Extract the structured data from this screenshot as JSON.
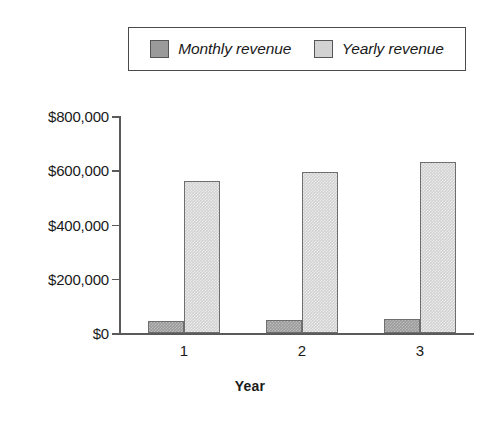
{
  "chart_data": {
    "type": "bar",
    "title": "",
    "subtitle": "",
    "xlabel": "Year",
    "ylabel": "",
    "categories": [
      "1",
      "2",
      "3"
    ],
    "series": [
      {
        "name": "Monthly revenue",
        "values": [
          45000,
          48000,
          50000
        ],
        "color": "#9a9a9a"
      },
      {
        "name": "Yearly revenue",
        "values": [
          560000,
          595000,
          630000
        ],
        "color": "#d2d2d2"
      }
    ],
    "ylim": [
      0,
      800000
    ],
    "y_ticks": [
      0,
      200000,
      400000,
      600000,
      800000
    ],
    "y_tick_labels": [
      "$0",
      "$200,000",
      "$400,000",
      "$600,000",
      "$800,000"
    ],
    "x_tick_labels": [
      "1",
      "2",
      "3"
    ],
    "grid": false,
    "legend_position": "top",
    "legend_entries": [
      "Monthly revenue",
      "Yearly revenue"
    ]
  },
  "legend": {
    "entries": [
      {
        "label": "Monthly revenue",
        "swatch_color": "#9a9a9a",
        "swatch_name": "legend-swatch-monthly"
      },
      {
        "label": "Yearly revenue",
        "swatch_color": "#d2d2d2",
        "swatch_name": "legend-swatch-yearly"
      }
    ]
  },
  "axes": {
    "x_title": "Year"
  }
}
